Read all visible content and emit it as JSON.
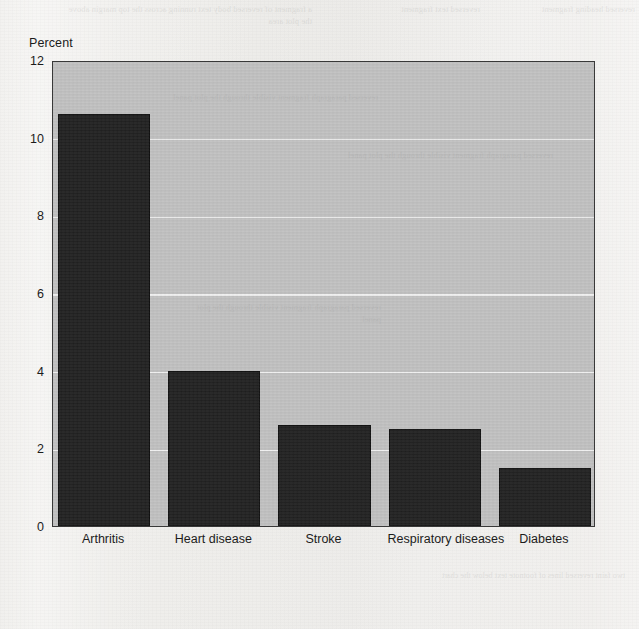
{
  "chart_data": {
    "type": "bar",
    "title": "",
    "subtitle": "",
    "xlabel": "",
    "ylabel": "Percent",
    "categories": [
      "Arthritis",
      "Heart disease",
      "Stroke",
      "Respiratory diseases",
      "Diabetes"
    ],
    "values": [
      10.6,
      4.0,
      2.6,
      2.5,
      1.5
    ],
    "ylim": [
      0,
      12
    ],
    "yticks": [
      0,
      2,
      4,
      6,
      8,
      10,
      12
    ],
    "ytick_labels": [
      "0",
      "2",
      "4",
      "6",
      "8",
      "10",
      "12"
    ],
    "grid": "horizontal",
    "legend": "none",
    "series": [
      {
        "name": "Percent",
        "values": [
          10.6,
          4.0,
          2.6,
          2.5,
          1.5
        ]
      }
    ],
    "annotations": []
  },
  "style": {
    "bar_color": "#232323",
    "plot_background": "#c2c2c2",
    "gridline_color": "#f2f2f2",
    "axis_color": "#3a3a3a",
    "page_background": "#f1f0ee",
    "text_color": "#1c1c1c"
  },
  "page": {
    "bleed_through": {
      "note": "faint mirrored show-through text from the reverse page; mostly illegible",
      "top_left": "a fragment of reversed body text running across the top margin above the plot area",
      "top_mid": "reversed text fragment",
      "top_right": "reversed heading fragment",
      "plot_a": "reversed paragraph fragment visible through the plot panel",
      "plot_b": "reversed paragraph fragment visible through the plot panel",
      "plot_c": "reversed paragraph fragment visible through the plot panel",
      "bottom": "two faint reversed lines of footnote text below the chart"
    }
  }
}
